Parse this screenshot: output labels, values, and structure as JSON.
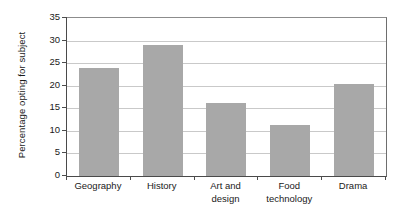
{
  "chart_data": {
    "type": "bar",
    "title": "",
    "subtitle": "",
    "xlabel": "",
    "ylabel": "Percentage opting for subject",
    "ylim": [
      0,
      35
    ],
    "yticks": [
      0,
      5,
      10,
      15,
      20,
      25,
      30,
      35
    ],
    "ytick_labels": [
      "0",
      "5",
      "10",
      "15",
      "20",
      "25",
      "30",
      "35"
    ],
    "grid": "horizontal",
    "legend": "none",
    "bar_color": "#a8a8a8",
    "axis_color": "#4a4a4a",
    "gridline_color": "#c9c9c9",
    "categories": [
      "Geography",
      "Art and design",
      "Food technology",
      "History",
      "Drama"
    ],
    "category_label_lines": [
      [
        "Geography"
      ],
      [
        "History"
      ],
      [
        "Art and",
        "design"
      ],
      [
        "Food",
        "technology"
      ],
      [
        "Drama"
      ]
    ],
    "bars": [
      {
        "category": "Geography",
        "value": 24.0
      },
      {
        "category": "History",
        "value": 29.1
      },
      {
        "category": "Art and design",
        "value": 16.1
      },
      {
        "category": "Food technology",
        "value": 11.3
      },
      {
        "category": "Drama",
        "value": 20.3
      }
    ],
    "values": [
      24.0,
      29.1,
      16.1,
      11.3,
      20.3
    ]
  }
}
